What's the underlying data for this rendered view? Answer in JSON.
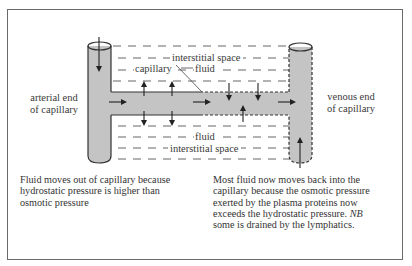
{
  "diagram": {
    "labels": {
      "arterial_end_line1": "arterial end",
      "arterial_end_line2": "of capillary",
      "venous_end_line1": "venous end",
      "venous_end_line2": "of capillary",
      "capillary": "capillary",
      "top_interstitial_space": "interstitial space",
      "top_fluid": "fluid",
      "bottom_fluid": "fluid",
      "bottom_interstitial_space": "interstitial space"
    },
    "captions": {
      "left": "Fluid moves out of capillary because hydrostatic pressure is higher than osmotic pressure",
      "right_part1": "Most fluid now moves back into the capillary because the osmotic pressure exerted by the plasma proteins now exceeds the hydrostatic pressure. ",
      "right_nb": "NB",
      "right_part2": " some is drained by the lymphatics."
    },
    "colors": {
      "vessel_fill": "#c4c4c4",
      "vessel_outline": "#333333",
      "frame": "#6a6a6a",
      "text": "#333333"
    }
  }
}
